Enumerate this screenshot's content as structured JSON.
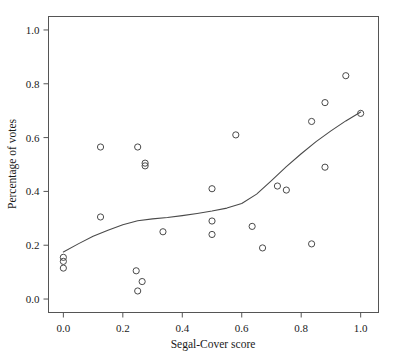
{
  "chart_data": {
    "type": "scatter",
    "title": "",
    "xlabel": "Segal-Cover score",
    "ylabel": "Percentage of votes",
    "xlim": [
      -0.05,
      1.06
    ],
    "ylim": [
      -0.05,
      1.05
    ],
    "xticks": [
      0.0,
      0.2,
      0.4,
      0.6,
      0.8,
      1.0
    ],
    "xtick_labels": [
      "0.0",
      "0.2",
      "0.4",
      "0.6",
      "0.8",
      "1.0"
    ],
    "yticks": [
      0.0,
      0.2,
      0.4,
      0.6,
      0.8,
      1.0
    ],
    "ytick_labels": [
      "0.0",
      "0.2",
      "0.4",
      "0.6",
      "0.8",
      "1.0"
    ],
    "grid": false,
    "legend": null,
    "marker": "open-circle",
    "points": [
      {
        "x": 0.0,
        "y": 0.155
      },
      {
        "x": 0.0,
        "y": 0.14
      },
      {
        "x": 0.0,
        "y": 0.115
      },
      {
        "x": 0.125,
        "y": 0.565
      },
      {
        "x": 0.125,
        "y": 0.305
      },
      {
        "x": 0.245,
        "y": 0.105
      },
      {
        "x": 0.25,
        "y": 0.03
      },
      {
        "x": 0.265,
        "y": 0.065
      },
      {
        "x": 0.25,
        "y": 0.565
      },
      {
        "x": 0.275,
        "y": 0.505
      },
      {
        "x": 0.275,
        "y": 0.495
      },
      {
        "x": 0.335,
        "y": 0.25
      },
      {
        "x": 0.5,
        "y": 0.41
      },
      {
        "x": 0.5,
        "y": 0.29
      },
      {
        "x": 0.5,
        "y": 0.24
      },
      {
        "x": 0.58,
        "y": 0.61
      },
      {
        "x": 0.635,
        "y": 0.27
      },
      {
        "x": 0.67,
        "y": 0.19
      },
      {
        "x": 0.72,
        "y": 0.42
      },
      {
        "x": 0.75,
        "y": 0.405
      },
      {
        "x": 0.835,
        "y": 0.66
      },
      {
        "x": 0.835,
        "y": 0.205
      },
      {
        "x": 0.88,
        "y": 0.73
      },
      {
        "x": 0.88,
        "y": 0.49
      },
      {
        "x": 0.95,
        "y": 0.83
      },
      {
        "x": 1.0,
        "y": 0.69
      }
    ],
    "series": [
      {
        "name": "smoothed-fit",
        "type": "line",
        "points": [
          {
            "x": 0.0,
            "y": 0.175
          },
          {
            "x": 0.05,
            "y": 0.205
          },
          {
            "x": 0.1,
            "y": 0.233
          },
          {
            "x": 0.15,
            "y": 0.256
          },
          {
            "x": 0.2,
            "y": 0.276
          },
          {
            "x": 0.25,
            "y": 0.291
          },
          {
            "x": 0.3,
            "y": 0.298
          },
          {
            "x": 0.35,
            "y": 0.303
          },
          {
            "x": 0.4,
            "y": 0.31
          },
          {
            "x": 0.45,
            "y": 0.318
          },
          {
            "x": 0.5,
            "y": 0.327
          },
          {
            "x": 0.55,
            "y": 0.338
          },
          {
            "x": 0.6,
            "y": 0.355
          },
          {
            "x": 0.65,
            "y": 0.39
          },
          {
            "x": 0.7,
            "y": 0.44
          },
          {
            "x": 0.75,
            "y": 0.492
          },
          {
            "x": 0.8,
            "y": 0.54
          },
          {
            "x": 0.85,
            "y": 0.585
          },
          {
            "x": 0.9,
            "y": 0.625
          },
          {
            "x": 0.95,
            "y": 0.662
          },
          {
            "x": 1.0,
            "y": 0.695
          }
        ]
      }
    ]
  }
}
